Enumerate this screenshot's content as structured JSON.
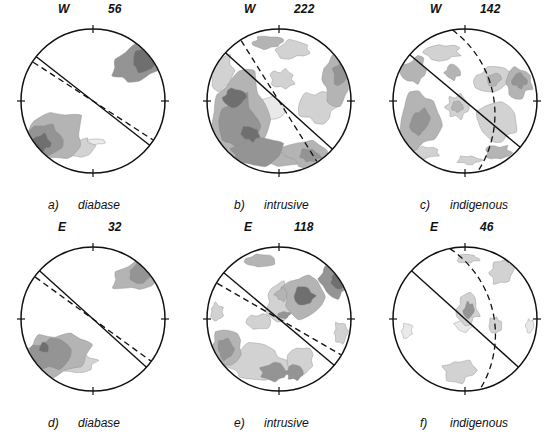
{
  "figure": {
    "type": "stereonet-grid",
    "rows": 2,
    "columns": 3,
    "background": "#ffffff",
    "line_color": "#111111",
    "contour_levels": [
      "#e9e9e9",
      "#d2d2d2",
      "#b4b4b4",
      "#949494",
      "#6f6f6f"
    ]
  },
  "panels": [
    {
      "id": "a",
      "letter": "a)",
      "name": "diabase",
      "direction": "W",
      "count": "56",
      "girdle_deg": 38,
      "dashed_deg": 33,
      "dashed_type": "line",
      "blobs": [
        {
          "cx": 0.62,
          "cy": -0.52,
          "r": 0.3,
          "level": 4,
          "sx": 1.35,
          "sy": 0.8,
          "rot": -25
        },
        {
          "cx": 0.7,
          "cy": -0.58,
          "r": 0.17,
          "level": 5,
          "sx": 1.1,
          "sy": 0.85,
          "rot": -25
        },
        {
          "cx": -0.6,
          "cy": 0.52,
          "r": 0.34,
          "level": 3,
          "sx": 1.45,
          "sy": 0.85,
          "rot": -20
        },
        {
          "cx": -0.66,
          "cy": 0.55,
          "r": 0.22,
          "level": 4,
          "sx": 1.15,
          "sy": 0.9,
          "rot": -20
        },
        {
          "cx": -0.72,
          "cy": 0.58,
          "r": 0.12,
          "level": 5,
          "sx": 1.05,
          "sy": 0.95,
          "rot": -20
        },
        {
          "cx": -0.25,
          "cy": 0.66,
          "r": 0.18,
          "level": 2,
          "sx": 1.4,
          "sy": 0.7,
          "rot": -8
        },
        {
          "cx": 0.05,
          "cy": 0.56,
          "r": 0.07,
          "level": 1,
          "sx": 1.6,
          "sy": 0.55,
          "rot": 0
        }
      ]
    },
    {
      "id": "b",
      "letter": "b)",
      "name": "intrusive",
      "direction": "W",
      "count": "222",
      "girdle_deg": 42,
      "dashed_deg": 58,
      "dashed_type": "line",
      "blobs": [
        {
          "cx": -0.55,
          "cy": 0.2,
          "r": 0.42,
          "level": 3,
          "sx": 1.0,
          "sy": 1.35,
          "rot": 10
        },
        {
          "cx": -0.58,
          "cy": 0.3,
          "r": 0.28,
          "level": 4,
          "sx": 0.95,
          "sy": 1.3,
          "rot": 10
        },
        {
          "cx": -0.62,
          "cy": -0.05,
          "r": 0.13,
          "level": 5,
          "sx": 1.1,
          "sy": 0.95,
          "rot": 0
        },
        {
          "cx": -0.4,
          "cy": 0.45,
          "r": 0.11,
          "level": 5,
          "sx": 1.1,
          "sy": 0.95,
          "rot": 0
        },
        {
          "cx": -0.3,
          "cy": 0.72,
          "r": 0.26,
          "level": 4,
          "sx": 1.3,
          "sy": 0.7,
          "rot": -5
        },
        {
          "cx": 0.05,
          "cy": 0.78,
          "r": 0.24,
          "level": 3,
          "sx": 1.4,
          "sy": 0.55,
          "rot": 0
        },
        {
          "cx": 0.38,
          "cy": 0.72,
          "r": 0.26,
          "level": 3,
          "sx": 1.2,
          "sy": 0.75,
          "rot": 10
        },
        {
          "cx": 0.42,
          "cy": 0.76,
          "r": 0.13,
          "level": 4,
          "sx": 1.1,
          "sy": 0.7,
          "rot": 10
        },
        {
          "cx": 0.8,
          "cy": -0.3,
          "r": 0.26,
          "level": 3,
          "sx": 0.7,
          "sy": 1.25,
          "rot": 0
        },
        {
          "cx": 0.84,
          "cy": -0.38,
          "r": 0.14,
          "level": 4,
          "sx": 0.7,
          "sy": 1.1,
          "rot": 0
        },
        {
          "cx": 0.55,
          "cy": 0.08,
          "r": 0.22,
          "level": 2,
          "sx": 1.1,
          "sy": 1.0,
          "rot": 0
        },
        {
          "cx": 0.2,
          "cy": -0.72,
          "r": 0.18,
          "level": 2,
          "sx": 1.3,
          "sy": 0.7,
          "rot": 0
        },
        {
          "cx": -0.15,
          "cy": -0.82,
          "r": 0.16,
          "level": 3,
          "sx": 1.3,
          "sy": 0.55,
          "rot": 0
        },
        {
          "cx": -0.8,
          "cy": -0.42,
          "r": 0.22,
          "level": 2,
          "sx": 0.8,
          "sy": 1.1,
          "rot": 0
        },
        {
          "cx": 0.05,
          "cy": -0.3,
          "r": 0.14,
          "level": 2,
          "sx": 1.1,
          "sy": 0.9,
          "rot": 0
        },
        {
          "cx": -0.1,
          "cy": 0.1,
          "r": 0.16,
          "level": 1,
          "sx": 1.3,
          "sy": 1.0,
          "rot": 0
        }
      ]
    },
    {
      "id": "c",
      "letter": "c)",
      "name": "indigenous",
      "direction": "W",
      "count": "142",
      "girdle_deg": 40,
      "dashed_deg": 80,
      "dashed_type": "arc",
      "blobs": [
        {
          "cx": -0.66,
          "cy": 0.28,
          "r": 0.34,
          "level": 3,
          "sx": 0.85,
          "sy": 1.3,
          "rot": 12
        },
        {
          "cx": -0.64,
          "cy": 0.3,
          "r": 0.17,
          "level": 4,
          "sx": 0.85,
          "sy": 1.1,
          "rot": 12
        },
        {
          "cx": -0.7,
          "cy": -0.42,
          "r": 0.18,
          "level": 3,
          "sx": 0.95,
          "sy": 1.0,
          "rot": 0
        },
        {
          "cx": -0.3,
          "cy": -0.68,
          "r": 0.18,
          "level": 2,
          "sx": 1.3,
          "sy": 0.6,
          "rot": 0
        },
        {
          "cx": -0.18,
          "cy": -0.4,
          "r": 0.1,
          "level": 3,
          "sx": 1.0,
          "sy": 1.0,
          "rot": 0
        },
        {
          "cx": -0.1,
          "cy": 0.08,
          "r": 0.16,
          "level": 2,
          "sx": 1.0,
          "sy": 1.0,
          "rot": 0
        },
        {
          "cx": -0.1,
          "cy": 0.08,
          "r": 0.08,
          "level": 3,
          "sx": 1.0,
          "sy": 1.0,
          "rot": 0
        },
        {
          "cx": 0.38,
          "cy": -0.28,
          "r": 0.2,
          "level": 2,
          "sx": 1.2,
          "sy": 0.9,
          "rot": 0
        },
        {
          "cx": 0.4,
          "cy": -0.3,
          "r": 0.09,
          "level": 3,
          "sx": 1.0,
          "sy": 1.0,
          "rot": 0
        },
        {
          "cx": 0.74,
          "cy": -0.26,
          "r": 0.2,
          "level": 3,
          "sx": 0.95,
          "sy": 1.0,
          "rot": 0
        },
        {
          "cx": 0.76,
          "cy": -0.28,
          "r": 0.1,
          "level": 4,
          "sx": 0.95,
          "sy": 1.0,
          "rot": 0
        },
        {
          "cx": 0.45,
          "cy": 0.3,
          "r": 0.26,
          "level": 2,
          "sx": 1.0,
          "sy": 1.1,
          "rot": 0
        },
        {
          "cx": 0.46,
          "cy": 0.72,
          "r": 0.16,
          "level": 3,
          "sx": 1.1,
          "sy": 0.65,
          "rot": 0
        },
        {
          "cx": 0.06,
          "cy": 0.82,
          "r": 0.12,
          "level": 2,
          "sx": 1.3,
          "sy": 0.5,
          "rot": 0
        },
        {
          "cx": -0.55,
          "cy": 0.72,
          "r": 0.14,
          "level": 2,
          "sx": 1.2,
          "sy": 0.6,
          "rot": 0
        }
      ]
    },
    {
      "id": "d",
      "letter": "d)",
      "name": "diabase",
      "direction": "E",
      "count": "32",
      "girdle_deg": 42,
      "dashed_deg": 36,
      "dashed_type": "line",
      "blobs": [
        {
          "cx": 0.62,
          "cy": -0.62,
          "r": 0.26,
          "level": 3,
          "sx": 1.3,
          "sy": 0.75,
          "rot": -28
        },
        {
          "cx": 0.66,
          "cy": -0.64,
          "r": 0.15,
          "level": 4,
          "sx": 1.1,
          "sy": 0.8,
          "rot": -28
        },
        {
          "cx": -0.55,
          "cy": 0.5,
          "r": 0.34,
          "level": 3,
          "sx": 1.4,
          "sy": 0.85,
          "rot": -14
        },
        {
          "cx": -0.6,
          "cy": 0.5,
          "r": 0.22,
          "level": 4,
          "sx": 1.2,
          "sy": 0.9,
          "rot": -14
        },
        {
          "cx": -0.68,
          "cy": 0.4,
          "r": 0.07,
          "level": 5,
          "sx": 1.0,
          "sy": 1.0,
          "rot": 0
        },
        {
          "cx": -0.22,
          "cy": 0.62,
          "r": 0.18,
          "level": 2,
          "sx": 1.4,
          "sy": 0.7,
          "rot": -8
        }
      ]
    },
    {
      "id": "e",
      "letter": "e)",
      "name": "intrusive",
      "direction": "E",
      "count": "118",
      "girdle_deg": 40,
      "dashed_deg": 30,
      "dashed_type": "line",
      "blobs": [
        {
          "cx": 0.34,
          "cy": -0.3,
          "r": 0.26,
          "level": 3,
          "sx": 1.1,
          "sy": 1.0,
          "rot": 0
        },
        {
          "cx": 0.36,
          "cy": -0.32,
          "r": 0.13,
          "level": 5,
          "sx": 1.0,
          "sy": 1.0,
          "rot": 0
        },
        {
          "cx": 0.02,
          "cy": -0.24,
          "r": 0.2,
          "level": 2,
          "sx": 1.0,
          "sy": 1.2,
          "rot": 0
        },
        {
          "cx": 0.04,
          "cy": -0.34,
          "r": 0.09,
          "level": 3,
          "sx": 1.0,
          "sy": 1.0,
          "rot": 0
        },
        {
          "cx": 0.07,
          "cy": -0.06,
          "r": 0.07,
          "level": 4,
          "sx": 1.2,
          "sy": 0.7,
          "rot": 0
        },
        {
          "cx": -0.26,
          "cy": 0.05,
          "r": 0.14,
          "level": 2,
          "sx": 1.2,
          "sy": 0.8,
          "rot": 0
        },
        {
          "cx": 0.78,
          "cy": -0.52,
          "r": 0.22,
          "level": 4,
          "sx": 0.85,
          "sy": 1.0,
          "rot": -20
        },
        {
          "cx": 0.82,
          "cy": -0.54,
          "r": 0.12,
          "level": 5,
          "sx": 0.85,
          "sy": 1.0,
          "rot": -20
        },
        {
          "cx": -0.26,
          "cy": -0.8,
          "r": 0.16,
          "level": 3,
          "sx": 1.2,
          "sy": 0.55,
          "rot": 0
        },
        {
          "cx": -0.72,
          "cy": 0.4,
          "r": 0.24,
          "level": 3,
          "sx": 0.95,
          "sy": 1.05,
          "rot": 0
        },
        {
          "cx": -0.74,
          "cy": 0.42,
          "r": 0.13,
          "level": 4,
          "sx": 0.95,
          "sy": 1.0,
          "rot": 0
        },
        {
          "cx": -0.3,
          "cy": 0.62,
          "r": 0.32,
          "level": 2,
          "sx": 1.4,
          "sy": 0.8,
          "rot": 0
        },
        {
          "cx": -0.1,
          "cy": 0.74,
          "r": 0.16,
          "level": 4,
          "sx": 1.0,
          "sy": 0.8,
          "rot": 0
        },
        {
          "cx": 0.22,
          "cy": 0.74,
          "r": 0.12,
          "level": 4,
          "sx": 1.0,
          "sy": 0.8,
          "rot": 0
        },
        {
          "cx": 0.3,
          "cy": 0.58,
          "r": 0.18,
          "level": 2,
          "sx": 1.0,
          "sy": 1.0,
          "rot": 0
        },
        {
          "cx": 0.86,
          "cy": 0.18,
          "r": 0.14,
          "level": 2,
          "sx": 0.7,
          "sy": 1.0,
          "rot": 0
        },
        {
          "cx": -0.86,
          "cy": -0.1,
          "r": 0.12,
          "level": 2,
          "sx": 0.7,
          "sy": 1.0,
          "rot": 0
        }
      ]
    },
    {
      "id": "f",
      "letter": "f)",
      "name": "indigenous",
      "direction": "E",
      "count": "46",
      "girdle_deg": 42,
      "dashed_deg": 78,
      "dashed_type": "arc",
      "blobs": [
        {
          "cx": 0.04,
          "cy": -0.14,
          "r": 0.18,
          "level": 2,
          "sx": 0.85,
          "sy": 1.1,
          "rot": 0
        },
        {
          "cx": 0.06,
          "cy": -0.12,
          "r": 0.1,
          "level": 4,
          "sx": 0.75,
          "sy": 1.1,
          "rot": 0
        },
        {
          "cx": -0.02,
          "cy": 0.1,
          "r": 0.11,
          "level": 1,
          "sx": 1.2,
          "sy": 0.7,
          "rot": 0
        },
        {
          "cx": 0.42,
          "cy": 0.1,
          "r": 0.11,
          "level": 2,
          "sx": 0.8,
          "sy": 1.1,
          "rot": 0
        },
        {
          "cx": 0.52,
          "cy": -0.64,
          "r": 0.16,
          "level": 2,
          "sx": 1.0,
          "sy": 1.0,
          "rot": -25
        },
        {
          "cx": 0.04,
          "cy": -0.84,
          "r": 0.13,
          "level": 2,
          "sx": 1.2,
          "sy": 0.45,
          "rot": 0
        },
        {
          "cx": -0.1,
          "cy": 0.72,
          "r": 0.2,
          "level": 2,
          "sx": 1.1,
          "sy": 0.75,
          "rot": 0
        },
        {
          "cx": -0.8,
          "cy": 0.16,
          "r": 0.1,
          "level": 1,
          "sx": 0.7,
          "sy": 1.1,
          "rot": 0
        },
        {
          "cx": 0.9,
          "cy": 0.1,
          "r": 0.09,
          "level": 1,
          "sx": 0.6,
          "sy": 1.0,
          "rot": 0
        }
      ]
    }
  ]
}
